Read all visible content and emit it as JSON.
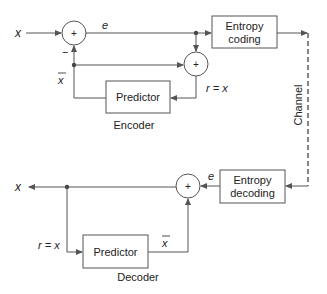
{
  "diagram": {
    "colors": {
      "line": "#555555",
      "text": "#222222",
      "background": "#ffffff"
    },
    "encoder": {
      "title": "Encoder",
      "input_label": "x",
      "error_label": "e",
      "minus_sign": "−",
      "prediction_label": "x",
      "reconstruction_label": "r = x",
      "summer1_sign": "+",
      "summer2_sign": "+",
      "predictor_label": "Predictor",
      "entropy_coding_line1": "Entropy",
      "entropy_coding_line2": "coding"
    },
    "channel": {
      "label": "Channel"
    },
    "decoder": {
      "title": "Decoder",
      "output_label": "x",
      "error_label": "e",
      "prediction_label": "x",
      "reconstruction_label": "r = x",
      "summer_sign": "+",
      "predictor_label": "Predictor",
      "entropy_decoding_line1": "Entropy",
      "entropy_decoding_line2": "decoding"
    }
  }
}
